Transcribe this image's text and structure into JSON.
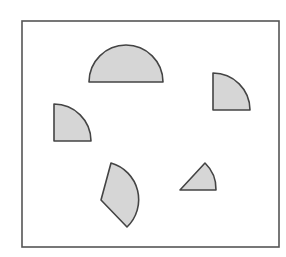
{
  "diagram": {
    "colors": {
      "background": "#ffffff",
      "frame_stroke": "#555555",
      "shape_fill": "#d6d6d6",
      "shape_stroke": "#444444"
    },
    "frame": {
      "x": 22,
      "y": 21,
      "width": 257,
      "height": 226
    },
    "shapes": [
      {
        "id": "semicircle",
        "type": "sector",
        "angle_deg": 180,
        "path": "M89,82 A37,37 0 0 1 163,82 Z"
      },
      {
        "id": "quarter-circle-right",
        "type": "sector",
        "angle_deg": 90,
        "path": "M213,110 L213,73 A37,37 0 0 1 250,110 Z"
      },
      {
        "id": "quarter-circle-left",
        "type": "sector",
        "angle_deg": 90,
        "path": "M54,141 L54,104 A37,37 0 0 1 91,141 Z"
      },
      {
        "id": "rotated-sector-bottom-left",
        "type": "sector",
        "angle_deg": 90,
        "path": "M101,200 L111,163 A38,38 0 0 1 127,227 Z"
      },
      {
        "id": "small-sector-bottom-right",
        "type": "sector",
        "angle_deg": 45,
        "path": "M180,190 L205,163 A36,36 0 0 1 216,190 Z"
      }
    ]
  }
}
